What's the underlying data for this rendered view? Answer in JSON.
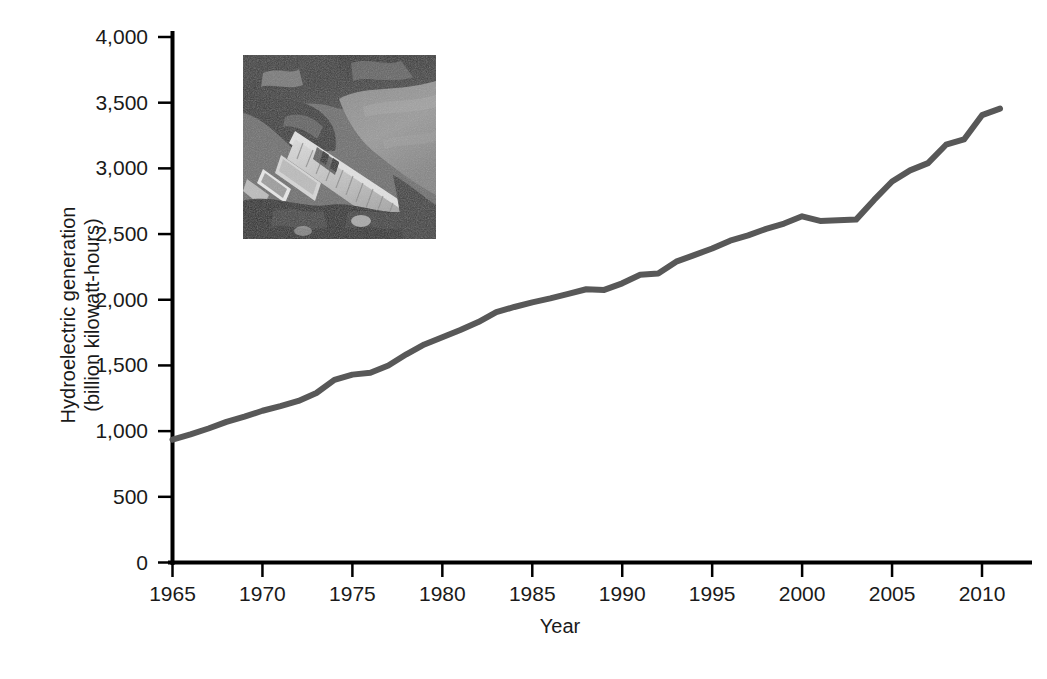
{
  "figure": {
    "background_color": "#ffffff",
    "line_color": "#585858",
    "axis_color": "#000000",
    "text_color": "#1a1a1a"
  },
  "axis_titles": {
    "y_line1": "Hydroelectric generation",
    "y_line2": "(billion kilowatt-hours)",
    "x": "Year"
  },
  "inset": {
    "name": "hydroelectric-dam-photo",
    "caption": "aerial photograph of a hydroelectric dam and reservoir",
    "left": 243,
    "top": 55,
    "width": 193,
    "height": 184
  },
  "chart_data": {
    "type": "line",
    "title": "",
    "xlabel": "Year",
    "ylabel": "Hydroelectric generation (billion kilowatt-hours)",
    "xlim": [
      1965,
      2011
    ],
    "ylim": [
      0,
      4000
    ],
    "xticks": [
      1965,
      1970,
      1975,
      1980,
      1985,
      1990,
      1995,
      2000,
      2005,
      2010
    ],
    "xtick_labels": [
      "1965",
      "1970",
      "1975",
      "1980",
      "1985",
      "1990",
      "1995",
      "2000",
      "2005",
      "2010"
    ],
    "yticks": [
      0,
      500,
      1000,
      1500,
      2000,
      2500,
      3000,
      3500,
      4000
    ],
    "ytick_labels": [
      "0",
      "500",
      "1,000",
      "1,500",
      "2,000",
      "2,500",
      "3,000",
      "3,500",
      "4,000"
    ],
    "grid": false,
    "legend": null,
    "series": [
      {
        "name": "World hydroelectric generation",
        "color": "#585858",
        "x": [
          1965,
          1966,
          1967,
          1968,
          1969,
          1970,
          1971,
          1972,
          1973,
          1974,
          1975,
          1976,
          1977,
          1978,
          1979,
          1980,
          1981,
          1982,
          1983,
          1984,
          1985,
          1986,
          1987,
          1988,
          1989,
          1990,
          1991,
          1992,
          1993,
          1994,
          1995,
          1996,
          1997,
          1998,
          1999,
          2000,
          2001,
          2002,
          2003,
          2004,
          2005,
          2006,
          2007,
          2008,
          2009,
          2010,
          2011
        ],
        "values": [
          935,
          975,
          1020,
          1070,
          1110,
          1155,
          1190,
          1230,
          1290,
          1390,
          1430,
          1445,
          1500,
          1585,
          1660,
          1715,
          1770,
          1830,
          1905,
          1945,
          1980,
          2010,
          2045,
          2080,
          2075,
          2125,
          2190,
          2200,
          2290,
          2340,
          2390,
          2450,
          2490,
          2540,
          2580,
          2635,
          2600,
          2605,
          2610,
          2760,
          2900,
          2985,
          3040,
          3180,
          3220,
          3405,
          3455
        ]
      }
    ]
  }
}
